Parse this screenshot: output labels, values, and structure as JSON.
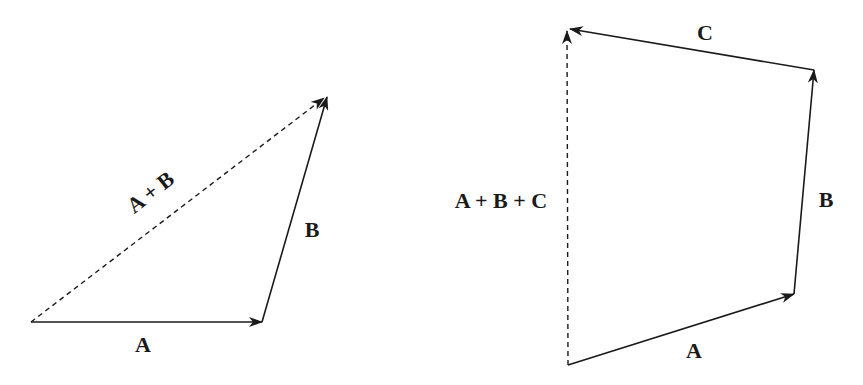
{
  "diagrams": [
    {
      "name": "two-vector-addition",
      "vectors": [
        {
          "label": "A",
          "from": [
            31,
            322
          ],
          "to": [
            262,
            322
          ],
          "style": "solid"
        },
        {
          "label": "B",
          "from": [
            262,
            322
          ],
          "to": [
            327,
            97
          ],
          "style": "solid"
        },
        {
          "label": "A + B",
          "from": [
            31,
            322
          ],
          "to": [
            324,
            98
          ],
          "style": "dashed"
        }
      ],
      "labels": {
        "a": "A",
        "b": "B",
        "sum": "A + B"
      }
    },
    {
      "name": "three-vector-addition",
      "vectors": [
        {
          "label": "A",
          "from": [
            568,
            365
          ],
          "to": [
            794,
            294
          ],
          "style": "solid"
        },
        {
          "label": "B",
          "from": [
            794,
            294
          ],
          "to": [
            814,
            70
          ],
          "style": "solid"
        },
        {
          "label": "C",
          "from": [
            814,
            70
          ],
          "to": [
            570,
            29
          ],
          "style": "solid"
        },
        {
          "label": "A + B + C",
          "from": [
            568,
            365
          ],
          "to": [
            567,
            31
          ],
          "style": "dashed"
        }
      ],
      "labels": {
        "a": "A",
        "b": "B",
        "c": "C",
        "sum": "A + B + C"
      }
    }
  ],
  "colors": {
    "ink": "#1a1a1a",
    "background": "#ffffff"
  }
}
